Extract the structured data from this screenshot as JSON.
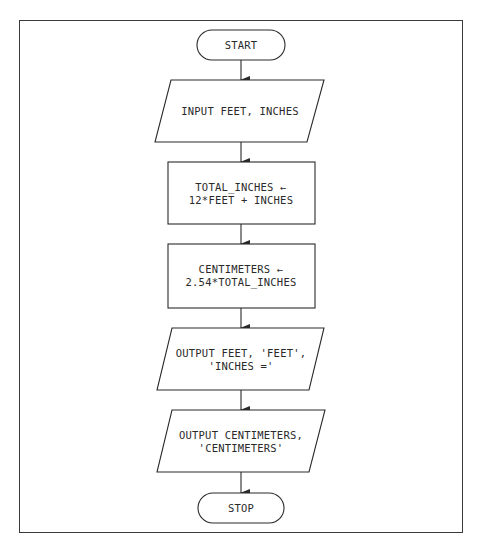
{
  "diagram": {
    "type": "flowchart",
    "colors": {
      "line": "#2a2a2a",
      "text": "#2a2a2a",
      "background": "#ffffff"
    },
    "nodes": [
      {
        "id": "start",
        "shape": "terminal",
        "lines": [
          "START"
        ]
      },
      {
        "id": "input",
        "shape": "parallelogram",
        "lines": [
          "INPUT FEET, INCHES"
        ]
      },
      {
        "id": "total",
        "shape": "process",
        "lines": [
          "TOTAL_INCHES ←",
          "12*FEET + INCHES"
        ]
      },
      {
        "id": "cm",
        "shape": "process",
        "lines": [
          "CENTIMETERS ←",
          "2.54*TOTAL_INCHES"
        ]
      },
      {
        "id": "out1",
        "shape": "parallelogram",
        "lines": [
          "OUTPUT FEET, 'FEET',",
          "'INCHES ='"
        ]
      },
      {
        "id": "out2",
        "shape": "parallelogram",
        "lines": [
          "OUTPUT CENTIMETERS,",
          "'CENTIMETERS'"
        ]
      },
      {
        "id": "stop",
        "shape": "terminal",
        "lines": [
          "STOP"
        ]
      }
    ],
    "edges": [
      {
        "from": "start",
        "to": "input"
      },
      {
        "from": "input",
        "to": "total"
      },
      {
        "from": "total",
        "to": "cm"
      },
      {
        "from": "cm",
        "to": "out1"
      },
      {
        "from": "out1",
        "to": "out2"
      },
      {
        "from": "out2",
        "to": "stop"
      }
    ]
  }
}
